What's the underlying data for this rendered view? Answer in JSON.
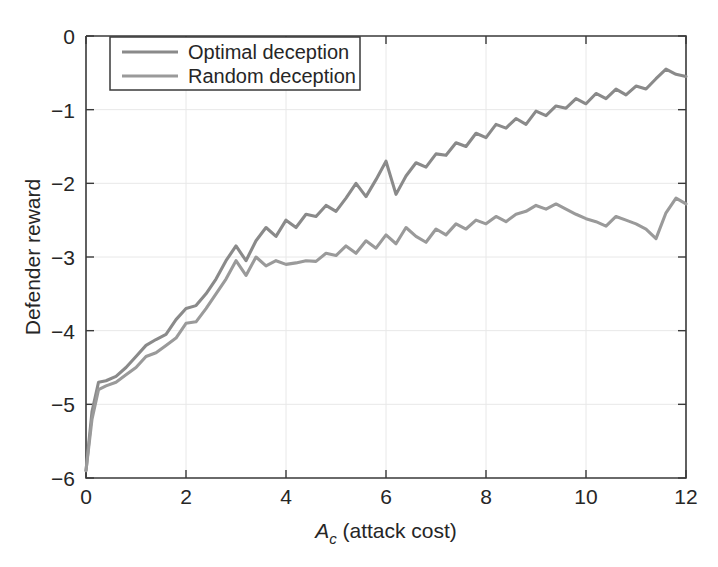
{
  "chart_data": {
    "type": "line",
    "title": "",
    "xlabel": "A_c (attack cost)",
    "xlabel_symbol": "A",
    "xlabel_subscript": "c",
    "xlabel_rest": " (attack cost)",
    "ylabel": "Defender reward",
    "xlim": [
      0,
      12
    ],
    "ylim": [
      -6,
      0
    ],
    "xticks": [
      0,
      2,
      4,
      6,
      8,
      10,
      12
    ],
    "xticklabels": [
      "0",
      "2",
      "4",
      "6",
      "8",
      "10",
      "12"
    ],
    "yticks": [
      0,
      -1,
      -2,
      -3,
      -4,
      -5,
      -6
    ],
    "yticklabels": [
      "0",
      "−1",
      "−2",
      "−3",
      "−4",
      "−5",
      "−6"
    ],
    "grid": true,
    "legend_position": "upper left",
    "line_color_optimal": "#8a8a8a",
    "line_color_random": "#9a9a9a",
    "axis_color": "#3a3a3a",
    "grid_color": "#e8e8e8",
    "background": "#ffffff",
    "series": [
      {
        "name": "Optimal deception",
        "color": "#8a8a8a",
        "x": [
          0.0,
          0.12,
          0.25,
          0.4,
          0.6,
          0.8,
          1.0,
          1.2,
          1.4,
          1.6,
          1.8,
          2.0,
          2.2,
          2.4,
          2.6,
          2.8,
          3.0,
          3.2,
          3.4,
          3.6,
          3.8,
          4.0,
          4.2,
          4.4,
          4.6,
          4.8,
          5.0,
          5.2,
          5.4,
          5.6,
          5.8,
          6.0,
          6.2,
          6.4,
          6.6,
          6.8,
          7.0,
          7.2,
          7.4,
          7.6,
          7.8,
          8.0,
          8.2,
          8.4,
          8.6,
          8.8,
          9.0,
          9.2,
          9.4,
          9.6,
          9.8,
          10.0,
          10.2,
          10.4,
          10.6,
          10.8,
          11.0,
          11.2,
          11.4,
          11.6,
          11.8,
          12.0
        ],
        "y": [
          -5.9,
          -5.1,
          -4.7,
          -4.68,
          -4.62,
          -4.5,
          -4.35,
          -4.2,
          -4.12,
          -4.05,
          -3.85,
          -3.7,
          -3.66,
          -3.5,
          -3.3,
          -3.05,
          -2.85,
          -3.05,
          -2.78,
          -2.6,
          -2.72,
          -2.5,
          -2.6,
          -2.42,
          -2.45,
          -2.3,
          -2.38,
          -2.2,
          -2.0,
          -2.18,
          -1.95,
          -1.7,
          -2.15,
          -1.9,
          -1.72,
          -1.78,
          -1.6,
          -1.62,
          -1.45,
          -1.5,
          -1.32,
          -1.38,
          -1.2,
          -1.25,
          -1.12,
          -1.2,
          -1.02,
          -1.08,
          -0.95,
          -0.98,
          -0.85,
          -0.92,
          -0.78,
          -0.85,
          -0.72,
          -0.8,
          -0.68,
          -0.72,
          -0.58,
          -0.45,
          -0.52,
          -0.55
        ]
      },
      {
        "name": "Random deception",
        "color": "#9a9a9a",
        "x": [
          0.0,
          0.12,
          0.25,
          0.4,
          0.6,
          0.8,
          1.0,
          1.2,
          1.4,
          1.6,
          1.8,
          2.0,
          2.2,
          2.4,
          2.6,
          2.8,
          3.0,
          3.2,
          3.4,
          3.6,
          3.8,
          4.0,
          4.2,
          4.4,
          4.6,
          4.8,
          5.0,
          5.2,
          5.4,
          5.6,
          5.8,
          6.0,
          6.2,
          6.4,
          6.6,
          6.8,
          7.0,
          7.2,
          7.4,
          7.6,
          7.8,
          8.0,
          8.2,
          8.4,
          8.6,
          8.8,
          9.0,
          9.2,
          9.4,
          9.6,
          9.8,
          10.0,
          10.2,
          10.4,
          10.6,
          10.8,
          11.0,
          11.2,
          11.4,
          11.6,
          11.8,
          12.0
        ],
        "y": [
          -5.9,
          -5.2,
          -4.8,
          -4.75,
          -4.7,
          -4.6,
          -4.5,
          -4.35,
          -4.3,
          -4.2,
          -4.1,
          -3.9,
          -3.88,
          -3.7,
          -3.5,
          -3.3,
          -3.05,
          -3.25,
          -3.0,
          -3.12,
          -3.05,
          -3.1,
          -3.08,
          -3.05,
          -3.06,
          -2.95,
          -2.98,
          -2.85,
          -2.95,
          -2.78,
          -2.88,
          -2.7,
          -2.82,
          -2.6,
          -2.72,
          -2.8,
          -2.62,
          -2.7,
          -2.55,
          -2.62,
          -2.5,
          -2.55,
          -2.45,
          -2.52,
          -2.42,
          -2.38,
          -2.3,
          -2.35,
          -2.28,
          -2.35,
          -2.42,
          -2.48,
          -2.52,
          -2.58,
          -2.45,
          -2.5,
          -2.55,
          -2.62,
          -2.75,
          -2.4,
          -2.2,
          -2.28
        ]
      }
    ],
    "legend_entries": [
      "Optimal deception",
      "Random deception"
    ]
  },
  "figure": {
    "plot_left": 86,
    "plot_right": 686,
    "plot_top": 36,
    "plot_bottom": 478
  }
}
